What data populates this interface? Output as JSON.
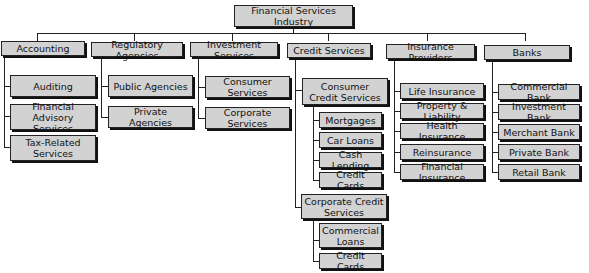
{
  "title": "Financial Services Industry",
  "root": {
    "label": "Financial Services Industry"
  },
  "categories": [
    {
      "label": "Accounting",
      "children": [
        {
          "label": "Auditing"
        },
        {
          "label": "Financial Advisory Services"
        },
        {
          "label": "Tax-Related Services"
        }
      ]
    },
    {
      "label": "Regulatory Agencies",
      "children": [
        {
          "label": "Public Agencies"
        },
        {
          "label": "Private Agencies"
        }
      ]
    },
    {
      "label": "Investment Services",
      "children": [
        {
          "label": "Consumer Services"
        },
        {
          "label": "Corporate Services"
        }
      ]
    },
    {
      "label": "Credit Services",
      "children": [
        {
          "label": "Consumer Credit Services",
          "children": [
            {
              "label": "Mortgages"
            },
            {
              "label": "Car Loans"
            },
            {
              "label": "Cash Lending"
            },
            {
              "label": "Credit Cards"
            }
          ]
        },
        {
          "label": "Corporate Credit Services",
          "children": [
            {
              "label": "Commercial Loans"
            },
            {
              "label": "Credit Cards"
            }
          ]
        }
      ]
    },
    {
      "label": "Insurance Providers",
      "children": [
        {
          "label": "Life Insurance"
        },
        {
          "label": "Property & Liability"
        },
        {
          "label": "Health Insurance"
        },
        {
          "label": "Reinsurance"
        },
        {
          "label": "Financial Insurance"
        }
      ]
    },
    {
      "label": "Banks",
      "children": [
        {
          "label": "Commercial Bank"
        },
        {
          "label": "Investment Bank"
        },
        {
          "label": "Merchant Bank"
        },
        {
          "label": "Private Bank"
        },
        {
          "label": "Retail Bank"
        }
      ]
    }
  ],
  "colors": {
    "box_fill": "#d2d2d2",
    "border": "#222222",
    "shadow": "#111111",
    "background": "#ffffff"
  }
}
